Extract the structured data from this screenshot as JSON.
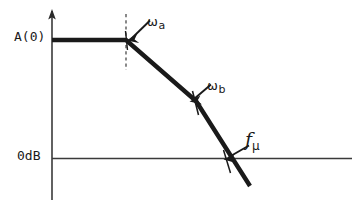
{
  "figure": {
    "kind": "bode-magnitude-sketch",
    "background_color": "#ffffff",
    "ink_color": "#1a1a1a"
  },
  "axes": {
    "y_axis_name": "gain-axis",
    "x_axis_name": "frequency-axis",
    "y_axis_has_arrow": true,
    "x_axis_has_arrow": false,
    "y_label_top": "A(0)",
    "y_label_zero": "0dB"
  },
  "annotations": [
    {
      "id": "wa",
      "name": "omega-a",
      "base": "ω",
      "sub": "a",
      "italic": false
    },
    {
      "id": "wb",
      "name": "omega-b",
      "base": "ω",
      "sub": "b",
      "italic": false
    },
    {
      "id": "fmu",
      "name": "f-mu",
      "base": "f",
      "sub": "μ",
      "italic": true
    }
  ],
  "labels": {
    "a0": "A(0)",
    "zero_db": "0dB",
    "omega_a_base": "ω",
    "omega_a_sub": "a",
    "omega_b_base": "ω",
    "omega_b_sub": "b",
    "f_mu_base": "f",
    "f_mu_sub": "μ"
  },
  "chart_data": {
    "type": "line",
    "title": "",
    "xlabel": "",
    "ylabel": "",
    "grid": false,
    "legend": "none",
    "xlim": [
      0,
      358
    ],
    "ylim": [
      210,
      0
    ],
    "series": [
      {
        "name": "gain-asymptote",
        "stroke": "#1a1a1a",
        "stroke_width": 4.2,
        "points_px": [
          [
            52,
            40
          ],
          [
            126,
            40
          ],
          [
            196,
            101
          ],
          [
            250,
            186
          ]
        ],
        "breakpoints": [
          {
            "label": "ωa",
            "px": [
              126,
              40
            ],
            "meaning": "first pole / flat-band corner"
          },
          {
            "label": "ωb",
            "px": [
              196,
              101
            ],
            "meaning": "second pole, slope steepens"
          },
          {
            "label": "fμ",
            "px": [
              228,
              159
            ],
            "meaning": "unity-gain (0 dB) crossing"
          }
        ]
      }
    ],
    "reference_lines": [
      {
        "name": "flat-gain-level",
        "value_label": "A(0)",
        "y_px": 40
      },
      {
        "name": "unity-gain-level",
        "value_label": "0dB",
        "y_px": 158
      }
    ],
    "dashed_guides": [
      {
        "name": "omega-a-guide",
        "x_px": 126,
        "y_from_px": 14,
        "y_to_px": 70
      }
    ]
  },
  "geometry": {
    "y_axis": {
      "x": 52,
      "y_top": 11,
      "y_bottom": 200,
      "arrow_tip_y": 10
    },
    "x_axis": {
      "y": 158,
      "x_left": 52,
      "x_right": 352
    },
    "curve_points": [
      [
        52,
        40
      ],
      [
        126,
        40
      ],
      [
        196,
        101
      ],
      [
        250,
        186
      ]
    ],
    "dashed_line": {
      "x": 126,
      "y1": 14,
      "y2": 70
    },
    "arrow_wa": {
      "from": [
        150,
        20
      ],
      "to": [
        129,
        40
      ]
    },
    "arrow_wb": {
      "from": [
        210,
        84
      ],
      "to": [
        191,
        101
      ]
    },
    "arrow_fmu": {
      "from": [
        248,
        146
      ],
      "to": [
        226,
        159
      ]
    },
    "tick_wa": {
      "x1": 125,
      "y1": 33,
      "x2": 127,
      "y2": 48
    },
    "tick_wb": {
      "x1": 193,
      "y1": 93,
      "x2": 197,
      "y2": 114
    },
    "tick_fmu": {
      "x1": 224,
      "y1": 152,
      "x2": 229,
      "y2": 172
    }
  }
}
